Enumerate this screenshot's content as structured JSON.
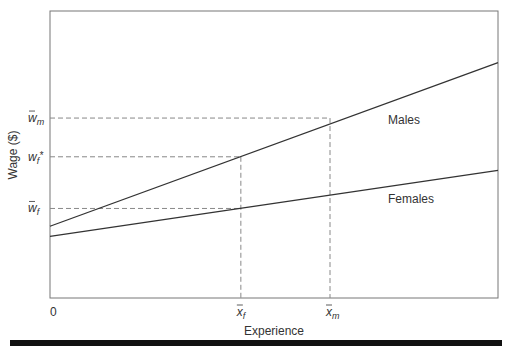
{
  "chart_data": {
    "type": "line",
    "title": "",
    "xlabel": "Experience",
    "ylabel": "Wage ($)",
    "xlim": [
      0,
      100
    ],
    "ylim": [
      0,
      100
    ],
    "grid": false,
    "x_origin_label": "0",
    "series": [
      {
        "name": "Males",
        "label": "Males",
        "x": [
          0,
          100
        ],
        "y": [
          25,
          82
        ]
      },
      {
        "name": "Females",
        "label": "Females",
        "x": [
          0,
          100
        ],
        "y": [
          21.5,
          44.5
        ]
      }
    ],
    "reference_points": {
      "x_f": {
        "label_base": "x",
        "label_sub": "f",
        "x": 42.6
      },
      "x_m": {
        "label_base": "x",
        "label_sub": "m",
        "x": 62.5
      }
    },
    "reference_levels": {
      "w_m": {
        "label_base": "w",
        "label_sub": "m",
        "y": 62.7,
        "bar": true,
        "star": false
      },
      "w_f_star": {
        "label_base": "w",
        "label_sub": "f",
        "y": 49.2,
        "bar": false,
        "star": true
      },
      "w_f": {
        "label_base": "w",
        "label_sub": "f",
        "y": 31.2,
        "bar": true,
        "star": false
      }
    },
    "line_labels": {
      "males": "Males",
      "females": "Females"
    }
  },
  "colors": {
    "line": "#333333",
    "dash": "#888888",
    "frame": "#555555",
    "bottom_bar": "#111111"
  }
}
